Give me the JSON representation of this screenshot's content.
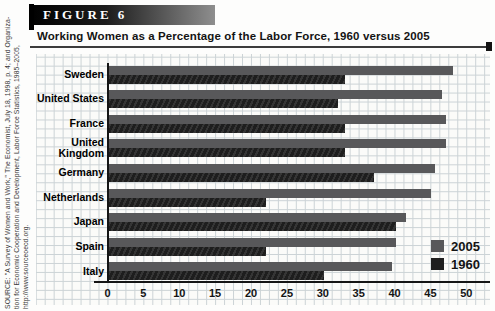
{
  "figure": {
    "label": "FIGURE 6",
    "title": "Working Women as a Percentage of the Labor Force, 1960 versus 2005"
  },
  "source": {
    "lines": [
      "SOURCE: \"A Survey of Women and Work,\" The Economist, July 18, 1998, p. 4; and Organiza-",
      "tion for Economic Cooperation and Development, Labor Force Statistics, 1985–2005,",
      "http://www.sourceoecd.org."
    ]
  },
  "colors": {
    "bar_2005": "#58585a",
    "bar_1960": "#1e1e1e",
    "grid": "#ccd3d6",
    "axis": "#151515"
  },
  "chart_data": {
    "type": "bar",
    "orientation": "horizontal",
    "title": "Working Women as a Percentage of the Labor Force, 1960 versus 2005",
    "categories": [
      "Sweden",
      "United States",
      "France",
      "United Kingdom",
      "Germany",
      "Netherlands",
      "Japan",
      "Spain",
      "Italy"
    ],
    "series": [
      {
        "name": "2005",
        "color": "#58585a",
        "values": [
          48,
          46.5,
          47,
          47,
          45.5,
          45,
          41.5,
          40,
          39.5
        ]
      },
      {
        "name": "1960",
        "color": "#1e1e1e",
        "values": [
          33,
          32,
          33,
          33,
          37,
          22,
          40,
          22,
          30
        ]
      }
    ],
    "xlabel": "",
    "ylabel": "",
    "xlim": [
      0,
      50
    ],
    "xticks": [
      0,
      5,
      10,
      15,
      20,
      25,
      30,
      35,
      40,
      45,
      50
    ],
    "grid": true,
    "legend_position": "inside-right-bottom"
  }
}
